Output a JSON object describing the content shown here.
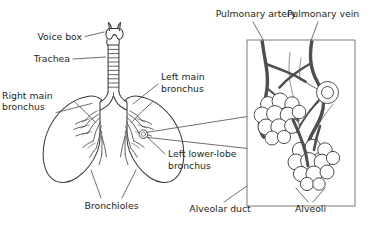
{
  "figure": {
    "background_color": "#ffffff",
    "line_color": "#3a3a3a",
    "text_color": "#231f20",
    "vessel_color": "#4f4f4f"
  },
  "labels": {
    "voice_box": "Voice box",
    "trachea": "Trachea",
    "right_main_bronchus_line1": "Right main",
    "right_main_bronchus_line2": "bronchus",
    "left_main_bronchus_line1": "Left main",
    "left_main_bronchus_line2": "bronchus",
    "left_lower_lobe_bronchus_line1": "Left lower-lobe",
    "left_lower_lobe_bronchus_line2": "bronchus",
    "bronchioles": "Bronchioles",
    "pulmonary_artery": "Pulmonary artery",
    "pulmonary_vein": "Pulmonary vein",
    "alveolar_duct": "Alveolar duct",
    "alveoli": "Alveoli"
  }
}
